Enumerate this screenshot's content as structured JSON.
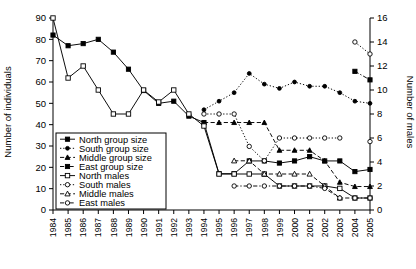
{
  "chart_data": {
    "type": "line",
    "title": "",
    "xlabel": "",
    "ylabel": "Number of individuals",
    "y2label": "Number of males",
    "x": [
      1984,
      1985,
      1986,
      1987,
      1988,
      1989,
      1990,
      1991,
      1992,
      1993,
      1994,
      1995,
      1996,
      1997,
      1998,
      1999,
      2000,
      2001,
      2002,
      2003,
      2004,
      2005
    ],
    "categories": [
      "1984",
      "1985",
      "1986",
      "1987",
      "1988",
      "1989",
      "1990",
      "1991",
      "1992",
      "1993",
      "1994",
      "1995",
      "1996",
      "1997",
      "1998",
      "1999",
      "2000",
      "2001",
      "2002",
      "2003",
      "2004",
      "2005"
    ],
    "ylim": [
      0,
      90
    ],
    "yticks": [
      0,
      10,
      20,
      30,
      40,
      50,
      60,
      70,
      80,
      90
    ],
    "y2lim": [
      0,
      16
    ],
    "y2ticks": [
      0,
      2,
      4,
      6,
      8,
      10,
      12,
      14,
      16
    ],
    "grid": false,
    "legend_position": "lower-left-inside",
    "series": [
      {
        "name": "North group size",
        "axis": "left",
        "marker": "filled-square",
        "line": "solid",
        "values": [
          82,
          77,
          78,
          80,
          74,
          66,
          56,
          50,
          51,
          44,
          41,
          17,
          17,
          23,
          23,
          22,
          23,
          25,
          23,
          23,
          18,
          19
        ]
      },
      {
        "name": "South group size",
        "axis": "left",
        "marker": "filled-circle",
        "line": "dotted",
        "values": [
          null,
          null,
          null,
          null,
          null,
          null,
          null,
          null,
          null,
          null,
          47,
          51,
          55,
          64,
          59,
          57,
          60,
          58,
          58,
          55,
          51,
          50
        ]
      },
      {
        "name": "Middle group size",
        "axis": "left",
        "marker": "filled-triangle",
        "line": "dashed",
        "values": [
          null,
          null,
          null,
          null,
          null,
          null,
          null,
          null,
          null,
          null,
          41,
          41,
          41,
          41,
          41,
          28,
          28,
          28,
          23,
          13,
          11,
          11
        ]
      },
      {
        "name": "East group size",
        "axis": "left",
        "marker": "filled-square",
        "line": "dash-dot",
        "values": [
          null,
          null,
          null,
          null,
          null,
          null,
          null,
          null,
          null,
          null,
          null,
          null,
          null,
          null,
          null,
          null,
          null,
          null,
          null,
          null,
          65,
          61
        ]
      },
      {
        "name": "North males",
        "axis": "right",
        "marker": "open-square",
        "line": "solid",
        "values": [
          16,
          11,
          12,
          10,
          8,
          8,
          10,
          9,
          10,
          8,
          7,
          3,
          3,
          3,
          3,
          2,
          2,
          2,
          2,
          1.8,
          1,
          1
        ]
      },
      {
        "name": "South males",
        "axis": "right",
        "marker": "open-circle",
        "line": "dotted",
        "values": [
          null,
          null,
          null,
          null,
          null,
          null,
          null,
          null,
          null,
          null,
          8,
          8,
          8,
          5.3,
          4.1,
          6,
          6,
          6,
          6,
          6,
          null,
          5.7
        ]
      },
      {
        "name": "Middle males",
        "axis": "right",
        "marker": "open-triangle",
        "line": "dashed",
        "values": [
          null,
          null,
          null,
          null,
          null,
          null,
          null,
          null,
          null,
          null,
          null,
          null,
          4.1,
          4.1,
          3,
          3,
          3,
          3,
          2,
          1,
          null,
          null
        ]
      },
      {
        "name": "East males",
        "axis": "right",
        "marker": "open-circle",
        "line": "dash-dot",
        "values": [
          null,
          null,
          null,
          null,
          null,
          null,
          null,
          null,
          null,
          null,
          null,
          null,
          2,
          2,
          2,
          2,
          2,
          2,
          1.8,
          1,
          1,
          1
        ]
      }
    ],
    "extra_points": [
      {
        "series": "North males",
        "x": 1984,
        "y": 16,
        "note": "top open circle at 90 individuals scale"
      },
      {
        "series": "East males",
        "x": 2004,
        "y": 14,
        "axis": "right",
        "note": "upper open circle"
      },
      {
        "series": "East males",
        "x": 2005,
        "y": 13,
        "axis": "right"
      }
    ],
    "legend": [
      {
        "label": "North group size",
        "marker": "filled-square",
        "line": "solid"
      },
      {
        "label": "South group size",
        "marker": "filled-circle",
        "line": "dotted"
      },
      {
        "label": "Middle group size",
        "marker": "filled-triangle",
        "line": "dashed"
      },
      {
        "label": "East group size",
        "marker": "filled-square",
        "line": "dash-dot"
      },
      {
        "label": "North males",
        "marker": "open-square",
        "line": "solid"
      },
      {
        "label": "South males",
        "marker": "open-circle",
        "line": "dotted"
      },
      {
        "label": "Middle males",
        "marker": "open-triangle",
        "line": "dashed"
      },
      {
        "label": "East males",
        "marker": "open-circle",
        "line": "dash-dot"
      }
    ],
    "colors": {
      "ink": "#000000",
      "background": "#ffffff"
    }
  }
}
